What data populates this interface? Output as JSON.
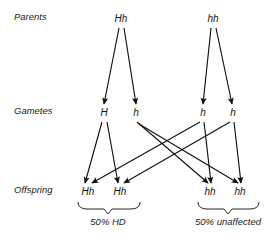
{
  "figure": {
    "type": "genetics-inheritance-diagram",
    "background_color": "#ffffff",
    "line_color": "#111111",
    "text_color": "#1a1a1a"
  },
  "rows": {
    "parents": {
      "label": "Parents",
      "label_x": 14,
      "label_y": 20,
      "y": 22
    },
    "gametes": {
      "label": "Gametes",
      "label_x": 14,
      "label_y": 114,
      "y": 116
    },
    "offspring": {
      "label": "Offspring",
      "label_x": 14,
      "label_y": 193,
      "y": 195
    }
  },
  "parents": [
    {
      "name": "parent-left",
      "genotype": "Hh",
      "x": 121,
      "y": 22
    },
    {
      "name": "parent-right",
      "genotype": "hh",
      "x": 213,
      "y": 22
    }
  ],
  "gametes": [
    {
      "name": "gamete-p1-H",
      "genotype": "H",
      "x": 104,
      "y": 116
    },
    {
      "name": "gamete-p1-h",
      "genotype": "h",
      "x": 136,
      "y": 116
    },
    {
      "name": "gamete-p2-h1",
      "genotype": "h",
      "x": 203,
      "y": 116
    },
    {
      "name": "gamete-p2-h2",
      "genotype": "h",
      "x": 233,
      "y": 116
    }
  ],
  "offspring": [
    {
      "name": "offspring-1",
      "genotype": "Hh",
      "x": 88,
      "y": 195
    },
    {
      "name": "offspring-2",
      "genotype": "Hh",
      "x": 120,
      "y": 195
    },
    {
      "name": "offspring-3",
      "genotype": "hh",
      "x": 210,
      "y": 195
    },
    {
      "name": "offspring-4",
      "genotype": "hh",
      "x": 240,
      "y": 195
    }
  ],
  "meiosis_arrows": [
    {
      "name": "arrow-parent1-to-H",
      "x1": 119,
      "y1": 28,
      "x2": 104,
      "y2": 104
    },
    {
      "name": "arrow-parent1-to-h",
      "x1": 124,
      "y1": 28,
      "x2": 136,
      "y2": 104
    },
    {
      "name": "arrow-parent2-to-h1",
      "x1": 211,
      "y1": 28,
      "x2": 203,
      "y2": 104
    },
    {
      "name": "arrow-parent2-to-h2",
      "x1": 216,
      "y1": 28,
      "x2": 232,
      "y2": 104
    }
  ],
  "fertilization_arrows": [
    {
      "name": "arrow-H-to-offspring1",
      "x1": 102,
      "y1": 122,
      "x2": 85,
      "y2": 183
    },
    {
      "name": "arrow-H-to-offspring2",
      "x1": 107,
      "y1": 122,
      "x2": 118,
      "y2": 183
    },
    {
      "name": "arrow-h-to-offspring3",
      "x1": 137,
      "y1": 122,
      "x2": 208,
      "y2": 183
    },
    {
      "name": "arrow-h-to-offspring4",
      "x1": 139,
      "y1": 124,
      "x2": 238,
      "y2": 183
    },
    {
      "name": "arrow-h1-to-offspring1",
      "x1": 200,
      "y1": 122,
      "x2": 92,
      "y2": 183
    },
    {
      "name": "arrow-h1-to-offspring3",
      "x1": 204,
      "y1": 122,
      "x2": 211,
      "y2": 183
    },
    {
      "name": "arrow-h2-to-offspring2",
      "x1": 230,
      "y1": 122,
      "x2": 124,
      "y2": 183
    },
    {
      "name": "arrow-h2-to-offspring4",
      "x1": 234,
      "y1": 122,
      "x2": 241,
      "y2": 183
    }
  ],
  "outcomes": [
    {
      "name": "outcome-hd",
      "label": "50% HD",
      "label_x": 108,
      "label_y": 225,
      "brace": {
        "left": 78,
        "right": 140,
        "center": 108,
        "top": 202,
        "bottom": 211
      }
    },
    {
      "name": "outcome-unaffected",
      "label": "50% unaffected",
      "label_x": 228,
      "label_y": 225,
      "brace": {
        "left": 198,
        "right": 259,
        "center": 228,
        "top": 202,
        "bottom": 211
      }
    }
  ]
}
